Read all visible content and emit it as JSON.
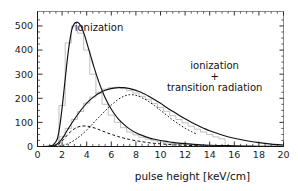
{
  "figure": {
    "background_color": "#ffffff",
    "frame_color": "#8a8a8a",
    "curve_color": "#101010",
    "histogram_color": "#b0b0b0"
  },
  "chart_data": {
    "type": "line",
    "title": "",
    "subtitle": "",
    "xlabel": "pulse height [keV/cm]",
    "ylabel": "",
    "xlim": [
      0,
      20
    ],
    "ylim": [
      0,
      560
    ],
    "grid": false,
    "legend_position": "inline-annotations",
    "xticks": [
      0,
      2,
      4,
      6,
      8,
      10,
      12,
      14,
      16,
      18,
      20
    ],
    "xtick_labels": [
      "0",
      "2",
      "4",
      "6",
      "8",
      "10",
      "12",
      "14",
      "16",
      "18",
      "20"
    ],
    "x_minor_tick_step": 0.5,
    "yticks": [
      0,
      100,
      200,
      300,
      400,
      500
    ],
    "ytick_labels": [
      "0",
      "100",
      "200",
      "300",
      "400",
      "500"
    ],
    "y_minor_tick_step": 25,
    "annotations": [
      {
        "name": "ionization-label",
        "text": "ionization",
        "x": 5.0,
        "y": 480
      },
      {
        "name": "ionization-plus-tr-label-line1",
        "text": "ionization",
        "x": 14.4,
        "y": 320
      },
      {
        "name": "ionization-plus-tr-label-line2",
        "text": "+",
        "x": 14.4,
        "y": 275
      },
      {
        "name": "ionization-plus-tr-label-line3",
        "text": "transition radiation",
        "x": 14.4,
        "y": 230
      }
    ],
    "series": [
      {
        "name": "ionization",
        "style": "solid",
        "description": "Landau-like ionization-only pulse height spectrum",
        "x": [
          0.0,
          0.5,
          1.0,
          1.3,
          1.6,
          1.8,
          2.0,
          2.2,
          2.4,
          2.6,
          2.8,
          3.0,
          3.2,
          3.4,
          3.6,
          3.8,
          4.0,
          4.3,
          4.6,
          5.0,
          5.4,
          5.8,
          6.2,
          6.6,
          7.0,
          7.5,
          8.0,
          8.5,
          9.0,
          9.5,
          10.0,
          10.5,
          11.0,
          11.5,
          12.0,
          13.0,
          14.0,
          15.0,
          16.0,
          17.0,
          18.0,
          19.0,
          20.0
        ],
        "y": [
          0,
          0,
          2,
          8,
          30,
          80,
          160,
          255,
          350,
          430,
          487,
          510,
          516,
          510,
          492,
          466,
          432,
          380,
          328,
          266,
          214,
          172,
          139,
          113,
          93,
          72,
          57,
          46,
          37,
          30,
          25,
          21,
          17,
          14,
          12,
          8,
          5,
          4,
          3,
          2,
          1,
          1,
          0
        ]
      },
      {
        "name": "ionization-plus-transition-radiation",
        "style": "solid",
        "description": "Total spectrum: ionization plus transition radiation",
        "x": [
          0.0,
          0.8,
          1.3,
          1.6,
          1.9,
          2.2,
          2.6,
          3.0,
          3.4,
          3.8,
          4.2,
          4.6,
          5.0,
          5.4,
          5.8,
          6.2,
          6.6,
          7.0,
          7.4,
          7.8,
          8.2,
          8.6,
          9.0,
          9.5,
          10.0,
          10.5,
          11.0,
          11.5,
          12.0,
          12.5,
          13.0,
          13.5,
          14.0,
          15.0,
          16.0,
          17.0,
          18.0,
          19.0,
          20.0
        ],
        "y": [
          0,
          0,
          3,
          10,
          25,
          48,
          82,
          113,
          142,
          168,
          190,
          207,
          221,
          231,
          238,
          242,
          244,
          244,
          241,
          236,
          229,
          220,
          210,
          195,
          179,
          162,
          146,
          130,
          115,
          101,
          88,
          76,
          65,
          48,
          34,
          24,
          16,
          10,
          6
        ]
      },
      {
        "name": "ionization-component-dashed",
        "style": "dashed",
        "description": "Dashed component: ionization contribution of the total spectrum",
        "x": [
          1.3,
          1.7,
          2.1,
          2.5,
          2.9,
          3.3,
          3.7,
          4.1,
          4.5,
          4.9,
          5.3,
          5.7,
          6.1,
          6.5,
          7.0,
          7.5,
          8.0,
          8.5,
          9.0,
          9.5,
          10.0,
          10.5,
          11.0,
          11.5,
          12.0,
          13.0,
          14.0,
          15.0,
          16.0
        ],
        "y": [
          0,
          8,
          28,
          52,
          70,
          81,
          85,
          84,
          79,
          72,
          64,
          56,
          49,
          42,
          35,
          29,
          24,
          20,
          16,
          13,
          11,
          9,
          7,
          6,
          5,
          3,
          2,
          1,
          0
        ]
      },
      {
        "name": "transition-radiation-component-dotted",
        "style": "dotted",
        "description": "Dotted component: transition radiation contribution rising to the total peak",
        "x": [
          1.5,
          2.0,
          2.5,
          3.0,
          3.5,
          4.0,
          4.5,
          5.0,
          5.5,
          6.0,
          6.5,
          7.0,
          7.5,
          8.0,
          8.5,
          9.0,
          9.5,
          10.0,
          10.5,
          11.0,
          11.5,
          12.0,
          12.5,
          13.0
        ],
        "y": [
          0,
          4,
          12,
          26,
          45,
          68,
          95,
          122,
          148,
          172,
          193,
          208,
          215,
          212,
          202,
          188,
          170,
          150,
          130,
          110,
          92,
          76,
          62,
          50
        ]
      },
      {
        "name": "ionization-histogram",
        "style": "histogram",
        "description": "Measured ionization-only pulse height histogram (light gray steps)",
        "bin_width": 0.5,
        "x": [
          2.0,
          2.5,
          3.0,
          3.5,
          4.0,
          4.5,
          5.0,
          5.5,
          6.0,
          6.5,
          7.0,
          7.5,
          8.0,
          8.5,
          9.0,
          9.5,
          10.0,
          10.5,
          11.0,
          11.5,
          12.0,
          12.5,
          13.0
        ],
        "y": [
          170,
          430,
          500,
          470,
          400,
          300,
          220,
          175,
          130,
          100,
          78,
          60,
          48,
          38,
          30,
          24,
          19,
          15,
          12,
          10,
          8,
          6,
          4
        ]
      },
      {
        "name": "total-histogram",
        "style": "histogram",
        "description": "Measured ionization + transition radiation histogram (light gray steps)",
        "bin_width": 0.5,
        "x": [
          2.0,
          2.5,
          3.0,
          3.5,
          4.0,
          4.5,
          5.0,
          5.5,
          6.0,
          6.5,
          7.0,
          7.5,
          8.0,
          8.5,
          9.0,
          9.5,
          10.0,
          10.5,
          11.0,
          11.5,
          12.0,
          12.5,
          13.0,
          13.5,
          14.0,
          14.5,
          15.0
        ],
        "y": [
          40,
          75,
          112,
          145,
          180,
          205,
          225,
          238,
          244,
          246,
          240,
          232,
          222,
          208,
          196,
          178,
          162,
          146,
          128,
          112,
          98,
          84,
          72,
          60,
          50,
          40,
          32
        ]
      }
    ]
  }
}
